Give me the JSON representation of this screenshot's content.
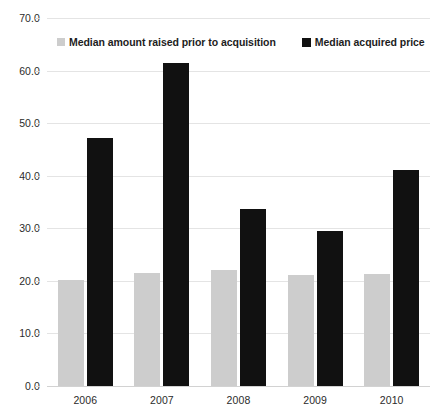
{
  "chart_data": {
    "type": "bar",
    "title": "",
    "subtitle": "",
    "xlabel": "",
    "ylabel": "",
    "categories": [
      "2006",
      "2007",
      "2008",
      "2009",
      "2010"
    ],
    "series": [
      {
        "name": "Median amount raised prior to acquisition",
        "color": "#cdcdcd",
        "values": [
          20.2,
          21.5,
          22.0,
          21.2,
          21.4
        ]
      },
      {
        "name": "Median acquired price",
        "color": "#111111",
        "values": [
          47.2,
          61.5,
          33.7,
          29.4,
          41.1
        ]
      }
    ],
    "ylim": [
      0,
      70
    ],
    "ytick_step": 10,
    "ytick_labels": [
      "0.0",
      "10.0",
      "20.0",
      "30.0",
      "40.0",
      "50.0",
      "60.0",
      "70.0"
    ],
    "grid": true,
    "legend_position": "top-left",
    "annotations": []
  },
  "colors": {
    "series_raised": "#cdcdcd",
    "series_acquired": "#111111",
    "gridline": "#e4e4e4",
    "axis": "#d2d2d2",
    "text": "#2b2b2b",
    "background": "#ffffff"
  }
}
